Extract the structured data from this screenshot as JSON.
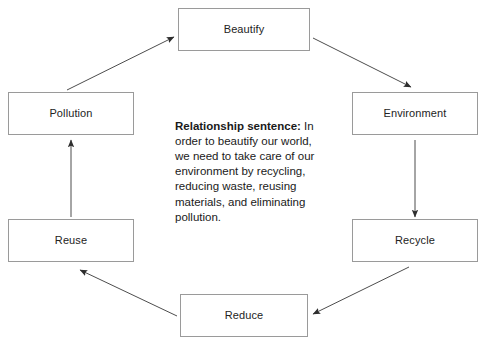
{
  "diagram": {
    "type": "cycle-flowchart",
    "nodes": [
      {
        "id": "beautify",
        "label": "Beautify"
      },
      {
        "id": "environment",
        "label": "Environment"
      },
      {
        "id": "recycle",
        "label": "Recycle"
      },
      {
        "id": "reduce",
        "label": "Reduce"
      },
      {
        "id": "reuse",
        "label": "Reuse"
      },
      {
        "id": "pollution",
        "label": "Pollution"
      }
    ],
    "edges": [
      {
        "from": "beautify",
        "to": "environment",
        "style": "diagonal-arrow"
      },
      {
        "from": "environment",
        "to": "recycle",
        "style": "vertical-arrow"
      },
      {
        "from": "recycle",
        "to": "reduce",
        "style": "diagonal-arrow"
      },
      {
        "from": "reduce",
        "to": "reuse",
        "style": "diagonal-arrow"
      },
      {
        "from": "reuse",
        "to": "pollution",
        "style": "vertical-arrow"
      },
      {
        "from": "pollution",
        "to": "beautify",
        "style": "diagonal-arrow"
      }
    ],
    "colors": {
      "background": "#ffffff",
      "node_border": "#9a9a9a",
      "node_fill": "#ffffff",
      "node_text": "#232323",
      "edge": "#4d4d4d",
      "body_text": "#1a1a1a"
    }
  },
  "relationship": {
    "lead_label": "Relationship sentence:",
    "body": " In order to beautify our world, we need to take care of our environment by recycling, reducing waste, reusing materials, and eliminating pollution."
  }
}
